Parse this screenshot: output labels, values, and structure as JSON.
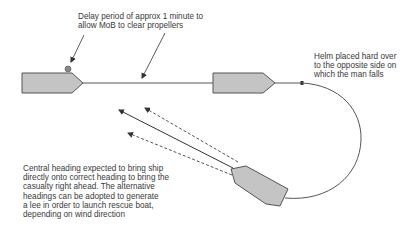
{
  "annotations": {
    "delay": {
      "lines": [
        "Delay period of approx 1 minute to",
        "allow MoB to clear propellers"
      ]
    },
    "helm": {
      "lines": [
        "Helm placed hard over",
        "to the opposite side on",
        "which the man falls"
      ]
    },
    "central": {
      "lines": [
        "Central heading expected to bring ship",
        "directly onto correct heading to bring the",
        "casualty right ahead. The alternative",
        "headings can be adopted to generate",
        "a lee in order to launch rescue boat,",
        "depending on wind direction"
      ]
    }
  },
  "colors": {
    "ship_fill": "#c4c4c4",
    "ship_stroke": "#555555",
    "track": "#555555",
    "mob_marker": "#888888"
  }
}
